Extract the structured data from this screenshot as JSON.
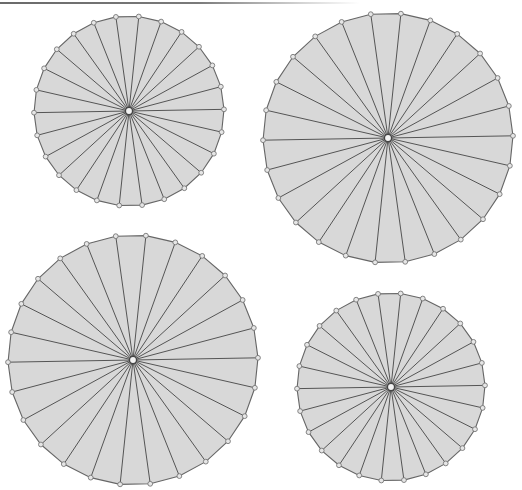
{
  "canvas": {
    "width": 522,
    "height": 490,
    "background": "#ffffff"
  },
  "style": {
    "wedge_fill": "#d8d8d8",
    "spoke_color": "#555555",
    "rim_color": "#666666",
    "vertex_fill": "#e6e6e6",
    "vertex_stroke": "#777777",
    "hub_fill": "#f2f2f2",
    "hub_stroke": "#444444"
  },
  "top_rule": {
    "color": "#6a6a6a",
    "y": 2
  },
  "wheels": [
    {
      "id": "wheel-top-left",
      "cx": 129,
      "cy": 111,
      "r": 95,
      "vertices": 26,
      "rotation_deg": -1.0
    },
    {
      "id": "wheel-top-right",
      "cx": 388,
      "cy": 138,
      "r": 125,
      "vertices": 26,
      "rotation_deg": -1.0
    },
    {
      "id": "wheel-bottom-left",
      "cx": 133,
      "cy": 360,
      "r": 125,
      "vertices": 26,
      "rotation_deg": -1.0
    },
    {
      "id": "wheel-bottom-right",
      "cx": 391,
      "cy": 387,
      "r": 94,
      "vertices": 26,
      "rotation_deg": -1.0
    }
  ]
}
